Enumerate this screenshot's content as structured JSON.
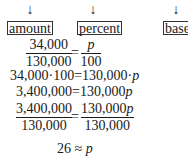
{
  "labels": {
    "arrow": "↓",
    "amount": "amount",
    "percent": "percent",
    "base": "base"
  },
  "steps": {
    "step1": {
      "left_num": "34,000",
      "left_den": "130,000",
      "eq": "=",
      "right_num": "p",
      "right_den": "100"
    },
    "step2": {
      "left": "34,000·100",
      "eq": "=",
      "right_a": "130,000·",
      "right_var": "p"
    },
    "step3": {
      "left": "3,400,000",
      "eq": "=",
      "right_a": "130,000",
      "right_var": "p"
    },
    "step4": {
      "left_num": "3,400,000",
      "left_den": "130,000",
      "eq": "=",
      "right_num_a": "130,000",
      "right_num_var": "p",
      "right_den": "130,000"
    },
    "step5": {
      "left": "26",
      "eq": "≈",
      "right_var": "p"
    }
  }
}
